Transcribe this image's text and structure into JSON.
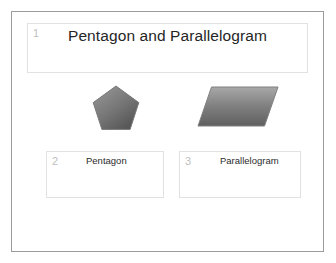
{
  "slide": {
    "title_placeholder": {
      "number": "1",
      "title": "Pentagon and Parallelogram"
    },
    "shapes": [
      {
        "name": "pentagon",
        "icon": "pentagon-shape",
        "fill_light": "#9a9a9a",
        "fill_dark": "#555555",
        "outline": "#7a7a7a"
      },
      {
        "name": "parallelogram",
        "icon": "parallelogram-shape",
        "fill_light": "#a3a3a3",
        "fill_dark": "#5f5f5f",
        "outline": "#808080"
      }
    ],
    "captions": [
      {
        "number": "2",
        "label": "Pentagon"
      },
      {
        "number": "3",
        "label": "Parallelogram"
      }
    ],
    "colors": {
      "frame_border": "#9c9c9c",
      "placeholder_border": "#e2e2e2",
      "placeholder_number": "#c0c0c0",
      "title_text": "#262626",
      "caption_text": "#2b2b2b",
      "background": "#ffffff"
    }
  }
}
